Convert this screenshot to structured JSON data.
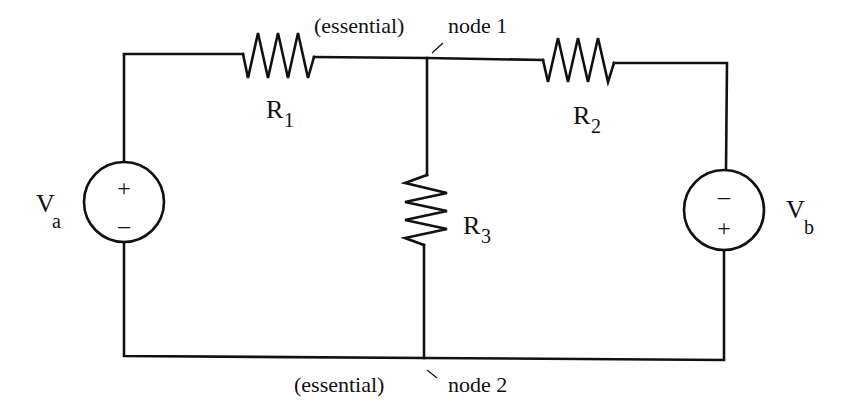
{
  "diagram": {
    "type": "circuit",
    "components": {
      "Va": {
        "label": "V",
        "subscript": "a",
        "polarity_top": "+",
        "polarity_bottom": "–"
      },
      "Vb": {
        "label": "V",
        "subscript": "b",
        "polarity_top": "–",
        "polarity_bottom": "+"
      },
      "R1": {
        "label": "R",
        "subscript": "1"
      },
      "R2": {
        "label": "R",
        "subscript": "2"
      },
      "R3": {
        "label": "R",
        "subscript": "3"
      }
    },
    "nodes": {
      "node1": {
        "qualifier": "(essential)",
        "name": "node 1"
      },
      "node2": {
        "qualifier": "(essential)",
        "name": "node 2"
      }
    },
    "colors": {
      "line": "#111111",
      "background": "#ffffff"
    }
  }
}
